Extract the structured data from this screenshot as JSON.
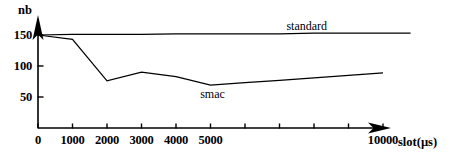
{
  "chart_data": {
    "type": "line",
    "title": "",
    "xlabel": "slot(µs)",
    "ylabel": "nb",
    "xlim": [
      0,
      11000
    ],
    "ylim": [
      0,
      170
    ],
    "grid": false,
    "legend_position": "inline-labels",
    "x_ticks": [
      0,
      1000,
      2000,
      3000,
      4000,
      5000,
      6000,
      7000,
      8000,
      9000,
      10000
    ],
    "x_tick_labels": [
      "0",
      "1000",
      "2000",
      "3000",
      "4000",
      "5000",
      "",
      "",
      "",
      "",
      "10000"
    ],
    "y_ticks": [
      50,
      100,
      150
    ],
    "y_tick_labels": [
      "50",
      "100",
      "150"
    ],
    "series": [
      {
        "name": "standard",
        "label": "standard",
        "color": "#000000",
        "x": [
          0,
          1000,
          2000,
          3000,
          4000,
          5000,
          6000,
          7000,
          8000,
          9000,
          10000,
          10800
        ],
        "values": [
          150,
          151,
          151,
          151,
          152,
          152,
          152,
          152,
          153,
          153,
          153,
          153
        ]
      },
      {
        "name": "smac",
        "label": "smac",
        "color": "#000000",
        "x": [
          0,
          1000,
          2000,
          3000,
          4000,
          5000,
          6000,
          7000,
          8000,
          9000,
          10000
        ],
        "values": [
          150,
          143,
          76,
          90,
          83,
          69,
          73,
          77,
          81,
          85,
          89
        ]
      }
    ],
    "annotations": [
      {
        "text": "standard",
        "x": 7200,
        "y": 163
      },
      {
        "text": "smac",
        "x": 4700,
        "y": 53
      }
    ]
  }
}
